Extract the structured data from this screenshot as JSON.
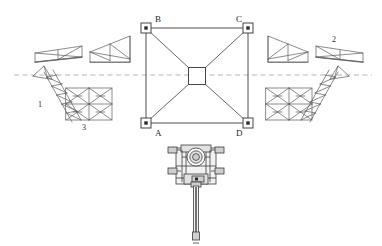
{
  "figure": {
    "kind": "engineering-assembly-diagram",
    "background_color": "#ffffff",
    "line_color": "#4a4a4a",
    "centerline_color": "#9a9a9a"
  },
  "frame": {
    "name": "square-truss-frame",
    "corner_labels": {
      "top_left": "B",
      "top_right": "C",
      "bottom_left": "A",
      "bottom_right": "D"
    },
    "hub_label": "",
    "geometry": {
      "left": 146,
      "top": 28,
      "right": 248,
      "bottom": 123,
      "hub_x": 197,
      "hub_y": 76,
      "hub_size": 17,
      "node_size": 10
    }
  },
  "centerline": {
    "name": "horizontal-centerline",
    "y": 75,
    "x_start": 14,
    "x_end": 372
  },
  "component_labels": [
    {
      "id": "1",
      "text": "1",
      "x": 40,
      "y": 105,
      "target": "left-diagonal-ladder-truss"
    },
    {
      "id": "2",
      "text": "2",
      "x": 334,
      "y": 40,
      "target": "right-shallow-wedge-truss"
    },
    {
      "id": "3",
      "text": "3",
      "x": 84,
      "y": 126,
      "target": "left-x-braced-panel"
    }
  ],
  "components": {
    "upper_left_shallow_wedge": {
      "name": "shallow-wedge-truss-left",
      "x": 35,
      "y": 50
    },
    "upper_left_triangular_wedge": {
      "name": "triangular-wedge-truss-left",
      "x": 92,
      "y": 42
    },
    "upper_right_triangular_wedge": {
      "name": "triangular-wedge-truss-right",
      "x": 272,
      "y": 42
    },
    "upper_right_shallow_wedge": {
      "name": "shallow-wedge-truss-right",
      "x": 316,
      "y": 50
    },
    "lower_left_diagonal_ladder": {
      "name": "diagonal-ladder-truss-left",
      "x": 33,
      "y": 70
    },
    "lower_left_x_panel": {
      "name": "x-braced-panel-left",
      "x": 90,
      "y": 90
    },
    "lower_right_x_panel": {
      "name": "x-braced-panel-right",
      "x": 262,
      "y": 90
    },
    "lower_right_diagonal_ladder": {
      "name": "diagonal-ladder-truss-right",
      "x": 328,
      "y": 70
    }
  },
  "mechanism": {
    "name": "central-actuator-assembly",
    "x": 168,
    "y": 142,
    "width": 56,
    "height": 104,
    "has_shaft": true,
    "has_circular_hub": true
  }
}
